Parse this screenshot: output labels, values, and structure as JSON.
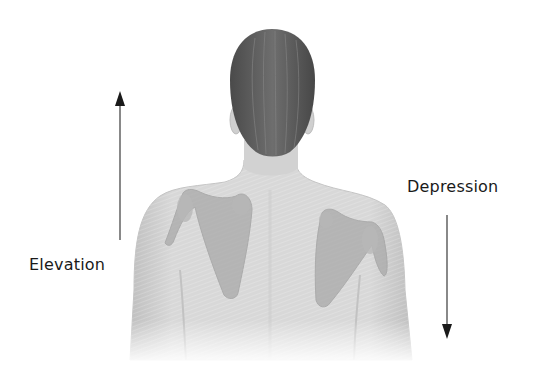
{
  "diagram": {
    "labels": {
      "elevation": "Elevation",
      "depression": "Depression"
    },
    "arrows": {
      "elevation": {
        "direction": "up"
      },
      "depression": {
        "direction": "down"
      }
    },
    "colors": {
      "background": "#ffffff",
      "skin": "#d9d9d9",
      "skin_shadow": "#bdbdbd",
      "hair": "#5a5a5a",
      "scapula": "#a8a8a8",
      "arrow": "#2a2a2a",
      "text": "#1a1a1a"
    }
  }
}
